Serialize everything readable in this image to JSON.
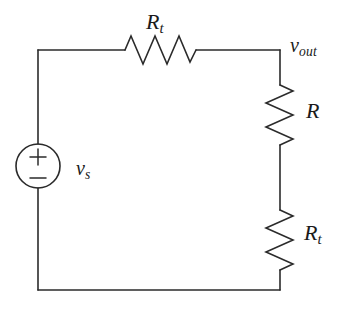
{
  "diagram": {
    "background_color": "#ffffff",
    "line_color": "#2b2b2b",
    "text_color": "#1a1a1a",
    "width": 337,
    "height": 310
  },
  "components": {
    "source": {
      "type": "independent-voltage-source",
      "symbol_plus": "+",
      "symbol_minus": "−",
      "label_main": "v",
      "label_sub": "s"
    },
    "resistor_top": {
      "type": "resistor",
      "orientation": "horizontal",
      "label_main": "R",
      "label_sub": "t"
    },
    "resistor_right_upper": {
      "type": "resistor",
      "orientation": "vertical",
      "label_main": "R",
      "label_sub": ""
    },
    "resistor_right_lower": {
      "type": "resistor",
      "orientation": "vertical",
      "label_main": "R",
      "label_sub": "t"
    }
  },
  "nodes": {
    "output": {
      "label_main": "v",
      "label_sub": "out"
    }
  }
}
